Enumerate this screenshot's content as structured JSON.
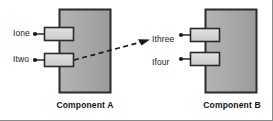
{
  "diagram": {
    "type": "uml-component-diagram",
    "background_color": "#ffffff",
    "frame_border_color": "#8a8a8a",
    "box_fill_color": "#a8a8a8",
    "box_border_color": "#2b2b2b",
    "port_fill_color": "#d4d4d4",
    "port_border_color": "#2b2b2b",
    "connector_color": "#1a1a1a",
    "text_color": "#1a1a1a"
  },
  "components": [
    {
      "id": "component-a",
      "caption": "Component A",
      "ports": [
        {
          "id": "port-ione",
          "label": "Ione"
        },
        {
          "id": "port-itwo",
          "label": "Itwo"
        }
      ]
    },
    {
      "id": "component-b",
      "caption": "Component B",
      "ports": [
        {
          "id": "port-ithree",
          "label": "Ithree"
        },
        {
          "id": "port-ifour",
          "label": "Ifour"
        }
      ]
    }
  ],
  "connector": {
    "id": "dependency-arrow",
    "style": "dashed",
    "arrowhead": "open-arrow",
    "from": "Itwo",
    "to": "Ithree",
    "label": ""
  }
}
